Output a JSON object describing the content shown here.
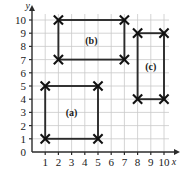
{
  "chart_data": {
    "type": "scatter",
    "title": "",
    "subtitle": "",
    "xlabel": "x",
    "ylabel": "y",
    "xlim": [
      0,
      10.8
    ],
    "ylim": [
      0,
      10.8
    ],
    "xticks": [
      1,
      2,
      3,
      4,
      5,
      6,
      7,
      8,
      9,
      10
    ],
    "yticks": [
      0,
      1,
      2,
      3,
      4,
      5,
      6,
      7,
      8,
      9,
      10
    ],
    "xtick_labels": [
      "1",
      "2",
      "3",
      "4",
      "5",
      "6",
      "7",
      "8",
      "9",
      "10"
    ],
    "ytick_labels": [
      "0",
      "1",
      "2",
      "3",
      "4",
      "5",
      "6",
      "7",
      "8",
      "9",
      "10"
    ],
    "grid": true,
    "legend_position": "none",
    "marker": "x",
    "series": [
      {
        "name": "(a)",
        "label": "(a)",
        "shape": "rectangle",
        "x_range": [
          1,
          5
        ],
        "y_range": [
          1,
          5
        ],
        "label_position": [
          3,
          3
        ],
        "points": [
          {
            "x": 1,
            "y": 1
          },
          {
            "x": 5,
            "y": 1
          },
          {
            "x": 5,
            "y": 5
          },
          {
            "x": 1,
            "y": 5
          }
        ]
      },
      {
        "name": "(b)",
        "label": "(b)",
        "shape": "rectangle",
        "x_range": [
          2,
          7
        ],
        "y_range": [
          7,
          10
        ],
        "label_position": [
          4.5,
          8.5
        ],
        "points": [
          {
            "x": 2,
            "y": 7
          },
          {
            "x": 7,
            "y": 7
          },
          {
            "x": 7,
            "y": 10
          },
          {
            "x": 2,
            "y": 10
          }
        ]
      },
      {
        "name": "(c)",
        "label": "(c)",
        "shape": "rectangle",
        "x_range": [
          8,
          10
        ],
        "y_range": [
          4,
          9
        ],
        "label_position": [
          9,
          6.5
        ],
        "points": [
          {
            "x": 8,
            "y": 4
          },
          {
            "x": 10,
            "y": 4
          },
          {
            "x": 10,
            "y": 9
          },
          {
            "x": 8,
            "y": 9
          }
        ]
      }
    ],
    "colors": {
      "background": "#ffffff",
      "grid": "#c9c9c9",
      "axis": "#2b2b2b",
      "marker": "#111111",
      "edge": "#2b2b2b",
      "text": "#1a1a1a"
    }
  }
}
